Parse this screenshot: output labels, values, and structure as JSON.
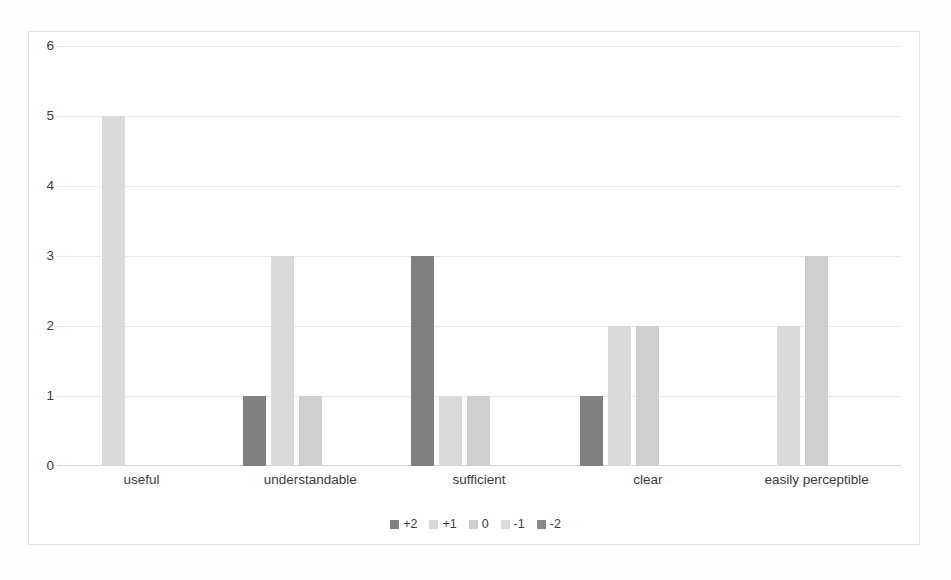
{
  "chart_data": {
    "type": "bar",
    "title": "",
    "subtitle": "",
    "xlabel": "",
    "ylabel": "",
    "ylim": [
      0,
      6
    ],
    "yticks": [
      "0",
      "1",
      "2",
      "3",
      "4",
      "5",
      "6"
    ],
    "grid": true,
    "legend_position": "bottom",
    "grouping": "grouped",
    "categories": [
      "useful",
      "understandable",
      "sufficient",
      "clear",
      "easily perceptible"
    ],
    "series": [
      {
        "name": "+2",
        "color": "#808080",
        "values": [
          0,
          1,
          3,
          1,
          0
        ]
      },
      {
        "name": "+1",
        "color": "#d9d9d9",
        "values": [
          5,
          3,
          1,
          2,
          2
        ]
      },
      {
        "name": "0",
        "color": "#cfcfcf",
        "values": [
          0,
          1,
          1,
          2,
          3
        ]
      },
      {
        "name": "-1",
        "color": "#dcdcdc",
        "values": [
          0,
          0,
          0,
          0,
          0
        ]
      },
      {
        "name": "-2",
        "color": "#8a8a8a",
        "values": [
          0,
          0,
          0,
          0,
          0
        ]
      }
    ]
  },
  "colors": {
    "grid": "#e8e8e8",
    "axis": "#d5d5d5",
    "text": "#3b3b3b",
    "frame": "#e3e3e3",
    "background": "#ffffff"
  }
}
